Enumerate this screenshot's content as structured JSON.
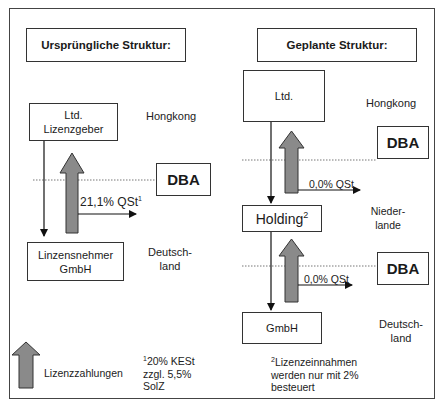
{
  "left": {
    "title": "Ursprüngliche Struktur:",
    "licensor_line1": "Ltd.",
    "licensor_line2": "Lizenzgeber",
    "licensor_country": "Hongkong",
    "dba_label": "DBA",
    "tax_label": "21,1% QSt",
    "tax_footnote_mark": "1",
    "licensee_line1": "Linzensnehmer",
    "licensee_line2": "GmbH",
    "licensee_country_line1": "Deutsch-",
    "licensee_country_line2": "land"
  },
  "right": {
    "title": "Geplante Struktur:",
    "top_entity": "Ltd.",
    "top_country": "Hongkong",
    "dba1_label": "DBA",
    "tax1_label": "0,0% QSt",
    "holding_label": "Holding",
    "holding_footnote_mark": "2",
    "holding_country_line1": "Nieder-",
    "holding_country_line2": "lande",
    "dba2_label": "DBA",
    "tax2_label": "0,0% QSt",
    "bottom_entity": "GmbH",
    "bottom_country_line1": "Deutsch-",
    "bottom_country_line2": "land"
  },
  "legend": {
    "arrow_label": "Lizenzzahlungen",
    "footnote1_mark": "1",
    "footnote1_line1": "20% KESt",
    "footnote1_line2": "zzgl. 5,5%",
    "footnote1_line3": "SolZ",
    "footnote2_mark": "2",
    "footnote2_line1": "Lizenzeinnahmen",
    "footnote2_line2": "werden nur mit 2%",
    "footnote2_line3": "besteuert"
  },
  "colors": {
    "arrow_fill": "#8a8a8a",
    "line": "#111111",
    "border": "#333333"
  }
}
